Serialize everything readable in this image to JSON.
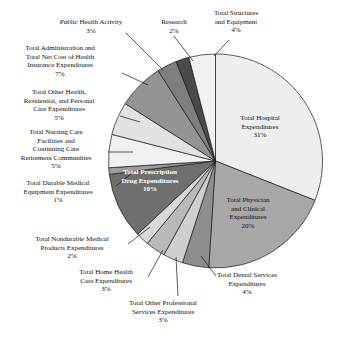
{
  "chart_data": {
    "type": "pie",
    "title": "",
    "subtitle": "",
    "xlabel": "",
    "ylabel": "",
    "legend": "none",
    "grid": false,
    "start_angle_deg": 0,
    "direction": "clockwise",
    "unit": "%",
    "categories": [
      "Total Hospital Expenditures",
      "Total Physician and Clinical Expenditures",
      "Total Dental Services Expenditures",
      "Total Other Professional Services Expenditures",
      "Total Home Health Care Expenditures",
      "Total Nondurable Medical Products Expenditures",
      "Total Prescription Drug Expenditures",
      "Total Durable Medical Equipment Expenditures",
      "Total Nursing Care Facilities and Continuing Care Retirement Communities",
      "Total Other Health, Residential, and Personal Care Expenditures",
      "Total Administration and Total Net Cost of Health Insurance Expenditures",
      "Public Health Activity",
      "Research",
      "Total Structures and Equipment"
    ],
    "values": [
      31,
      20,
      4,
      3,
      3,
      2,
      10,
      1,
      5,
      5,
      7,
      3,
      2,
      4
    ],
    "colors": [
      "#eeeeec",
      "#a8a8a6",
      "#8e8e8c",
      "#cfcfcd",
      "#b9b9b7",
      "#d8d8d6",
      "#6f6f6d",
      "#9d9d9b",
      "#f0f0ee",
      "#e2e2e0",
      "#949492",
      "#7f7f7d",
      "#4a4a48",
      "#f2f2f0"
    ],
    "slices": [
      {
        "label": "Total Hospital Expenditures",
        "value": 31,
        "pct_text": "31%",
        "color": "#eeeeec"
      },
      {
        "label": "Total Physician and Clinical Expenditures",
        "value": 20,
        "pct_text": "20%",
        "color": "#a8a8a6"
      },
      {
        "label": "Total Dental Services Expenditures",
        "value": 4,
        "pct_text": "4%",
        "color": "#8e8e8c"
      },
      {
        "label": "Total Other Professional Services Expenditures",
        "value": 3,
        "pct_text": "3%",
        "color": "#cfcfcd"
      },
      {
        "label": "Total Home Health Care Expenditures",
        "value": 3,
        "pct_text": "3%",
        "color": "#b9b9b7"
      },
      {
        "label": "Total Nondurable Medical Products Expenditures",
        "value": 2,
        "pct_text": "2%",
        "color": "#d8d8d6"
      },
      {
        "label": "Total Prescription Drug Expenditures",
        "value": 10,
        "pct_text": "10%",
        "color": "#6f6f6d"
      },
      {
        "label": "Total Durable Medical Equipment Expenditures",
        "value": 1,
        "pct_text": "1%",
        "color": "#9d9d9b"
      },
      {
        "label": "Total Nursing Care Facilities and Continuing Care Retirement Communities",
        "value": 5,
        "pct_text": "5%",
        "color": "#f0f0ee"
      },
      {
        "label": "Total Other Health, Residential, and Personal Care Expenditures",
        "value": 5,
        "pct_text": "5%",
        "color": "#e2e2e0"
      },
      {
        "label": "Total Administration and Total Net Cost of Health Insurance Expenditures",
        "value": 7,
        "pct_text": "7%",
        "color": "#949492"
      },
      {
        "label": "Public Health Activity",
        "value": 3,
        "pct_text": "3%",
        "color": "#7f7f7d"
      },
      {
        "label": "Research",
        "value": 2,
        "pct_text": "2%",
        "color": "#4a4a48"
      },
      {
        "label": "Total Structures and Equipment",
        "value": 4,
        "pct_text": "4%",
        "color": "#f2f2f0"
      }
    ]
  },
  "labels": {
    "hospital": {
      "name": "Total Hospital\nExpenditures",
      "pct": "31%"
    },
    "physician": {
      "name": "Total Physician\nand Clinical\nExpenditures",
      "pct": "20%"
    },
    "dental": {
      "name": "Total Dental Services\nExpenditures",
      "pct": "4%"
    },
    "other_professional": {
      "name": "Total Other Professional\nServices Expenditures",
      "pct": "3%"
    },
    "home_health": {
      "name": "Total Home Health\nCare Expenditures",
      "pct": "3%"
    },
    "nondurable": {
      "name": "Total Nondurable Medical\nProducts Expenditures",
      "pct": "2%"
    },
    "prescription": {
      "name": "Total Prescription\nDrug Expenditures",
      "pct": "10%"
    },
    "durable": {
      "name": "Total Durable Medical\nEquipment Expenditures",
      "pct": "1%"
    },
    "nursing": {
      "name": "Total Nursing Care\nFacilities and\nContinuing Care\nRetirement Communities",
      "pct": "5%"
    },
    "other_health": {
      "name": "Total Other Health,\nResidential, and Personal\nCare Expenditures",
      "pct": "5%"
    },
    "administration": {
      "name": "Total Administration and\nTotal Net Cost of Health\nInsurance Expenditures",
      "pct": "7%"
    },
    "public_health": {
      "name": "Public Health Activity",
      "pct": "3%"
    },
    "research": {
      "name": "Research",
      "pct": "2%"
    },
    "structures": {
      "name": "Total Structures\nand Equipment",
      "pct": "4%"
    }
  }
}
